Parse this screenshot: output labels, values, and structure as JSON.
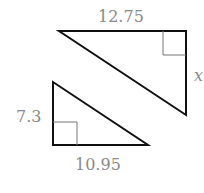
{
  "diagram": {
    "triangle_top": {
      "top_side_label": "12.75",
      "right_side_label": "x",
      "right_angle_corner": "top-right"
    },
    "triangle_bottom": {
      "left_side_label": "7.3",
      "bottom_side_label": "10.95",
      "right_angle_corner": "bottom-left"
    },
    "colors": {
      "stroke": "#111111",
      "label": "#8a8a8a",
      "right_angle_marker": "#777777"
    }
  }
}
